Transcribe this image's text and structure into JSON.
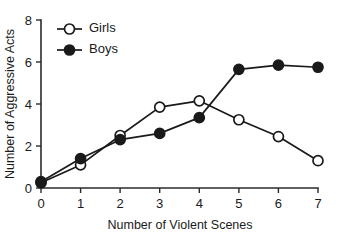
{
  "chart_data": {
    "type": "line",
    "title": "",
    "subtitle": "",
    "xlabel": "Number of Violent Scenes",
    "ylabel": "Number of Aggressive Acts",
    "x": [
      0,
      1,
      2,
      3,
      4,
      5,
      6,
      7
    ],
    "xlim": [
      0,
      7
    ],
    "ylim": [
      0,
      8
    ],
    "xticks": [
      "0",
      "1",
      "2",
      "3",
      "4",
      "5",
      "6",
      "7"
    ],
    "yticks": [
      "0",
      "2",
      "4",
      "6",
      "8"
    ],
    "ytick_values": [
      0,
      2,
      4,
      6,
      8
    ],
    "grid": false,
    "legend_position": "top-left",
    "series": [
      {
        "name": "Girls",
        "marker": "open-circle",
        "color": "#1a1a1a",
        "values": [
          0.25,
          1.1,
          2.5,
          3.85,
          4.15,
          3.25,
          2.45,
          1.3
        ]
      },
      {
        "name": "Boys",
        "marker": "filled-circle",
        "color": "#1a1a1a",
        "values": [
          0.3,
          1.4,
          2.3,
          2.6,
          3.35,
          5.65,
          5.85,
          5.75
        ]
      }
    ]
  },
  "legend": {
    "items": [
      {
        "label": "Girls",
        "marker": "open-circle"
      },
      {
        "label": "Boys",
        "marker": "filled-circle"
      }
    ]
  },
  "axes": {
    "x_title": "Number of Violent Scenes",
    "y_title": "Number of Aggressive Acts"
  }
}
